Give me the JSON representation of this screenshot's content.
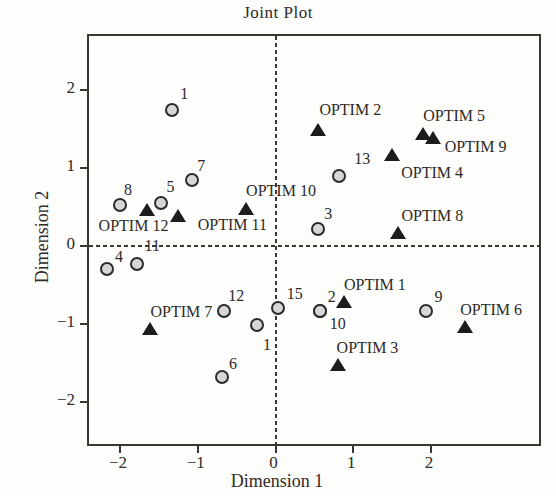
{
  "title": "Joint Plot",
  "colors": {
    "background": "#fdfdfc",
    "axis": "#3a3631",
    "text": "#2e2a26",
    "circle_fill": "#d6d6d6",
    "circle_edge": "#2b2b2b",
    "triangle_fill": "#1c1c1c",
    "dashed_line": "#3c3933"
  },
  "chart_data": {
    "type": "scatter",
    "title": "Joint Plot",
    "xlabel": "Dimension 1",
    "ylabel": "Dimension 2",
    "xlim": [
      -2.4,
      3.39
    ],
    "ylim": [
      -2.54,
      2.69
    ],
    "x_ticks": [
      -2,
      -1,
      0,
      1,
      2
    ],
    "y_ticks": [
      2,
      1,
      0,
      -1,
      -2
    ],
    "grid": false,
    "legend": "none",
    "reference_lines": {
      "vertical_at_x": 0,
      "horizontal_at_y": 0,
      "style": "dashed"
    },
    "series": [
      {
        "name": "cases",
        "marker": "circle",
        "points": [
          {
            "label": "1",
            "x": -1.33,
            "y": 1.74,
            "label_dx": 12,
            "label_dy": -16
          },
          {
            "label": "7",
            "x": -1.07,
            "y": 0.84,
            "label_dx": 9,
            "label_dy": -14
          },
          {
            "label": "8",
            "x": -2.0,
            "y": 0.53,
            "label_dx": 8,
            "label_dy": -15
          },
          {
            "label": "5",
            "x": -1.48,
            "y": 0.55,
            "label_dx": 10,
            "label_dy": -16
          },
          {
            "label": "13",
            "x": 0.82,
            "y": 0.89,
            "label_dx": 23,
            "label_dy": -17
          },
          {
            "label": "3",
            "x": 0.55,
            "y": 0.22,
            "label_dx": 10,
            "label_dy": -15
          },
          {
            "label": "4",
            "x": -2.17,
            "y": -0.3,
            "label_dx": 12,
            "label_dy": -12
          },
          {
            "label": "11",
            "x": -1.78,
            "y": -0.23,
            "label_dx": 15,
            "label_dy": -18
          },
          {
            "label": "12",
            "x": -0.66,
            "y": -0.84,
            "label_dx": 12,
            "label_dy": -15
          },
          {
            "label": "15",
            "x": 0.03,
            "y": -0.8,
            "label_dx": 17,
            "label_dy": -14
          },
          {
            "label": "2",
            "x": 0.57,
            "y": -0.84,
            "label_dx": 12,
            "label_dy": -14
          },
          {
            "label": "10",
            "x": 0.57,
            "y": -0.84,
            "label_dx": 18,
            "label_dy": 13
          },
          {
            "label": "9",
            "x": 1.93,
            "y": -0.83,
            "label_dx": 13,
            "label_dy": -14
          },
          {
            "label": "1",
            "x": -0.24,
            "y": -1.02,
            "label_dx": 10,
            "label_dy": 20
          },
          {
            "label": "6",
            "x": -0.69,
            "y": -1.68,
            "label_dx": 11,
            "label_dy": -13
          }
        ]
      },
      {
        "name": "OPTIM",
        "marker": "triangle",
        "points": [
          {
            "label": "OPTIM 2",
            "x": 0.55,
            "y": 1.48,
            "label_dx": 32,
            "label_dy": -20
          },
          {
            "label": "OPTIM 5",
            "x": 1.9,
            "y": 1.43,
            "label_dx": 31,
            "label_dy": -18
          },
          {
            "label": "OPTIM 9",
            "x": 2.02,
            "y": 1.38,
            "label_dx": 43,
            "label_dy": 9
          },
          {
            "label": "OPTIM 4",
            "x": 1.5,
            "y": 1.17,
            "label_dx": 40,
            "label_dy": 18
          },
          {
            "label": "OPTIM 8",
            "x": 1.58,
            "y": 0.17,
            "label_dx": 34,
            "label_dy": -17
          },
          {
            "label": "OPTIM 10",
            "x": -0.38,
            "y": 0.47,
            "label_dx": 35,
            "label_dy": -18
          },
          {
            "label": "OPTIM 12",
            "x": -1.66,
            "y": 0.46,
            "label_dx": -13,
            "label_dy": 16
          },
          {
            "label": "OPTIM 11",
            "x": -1.25,
            "y": 0.38,
            "label_dx": 54,
            "label_dy": 9
          },
          {
            "label": "OPTIM 7",
            "x": -1.61,
            "y": -1.06,
            "label_dx": 31,
            "label_dy": -17
          },
          {
            "label": "OPTIM 1",
            "x": 0.88,
            "y": -0.72,
            "label_dx": 31,
            "label_dy": -17
          },
          {
            "label": "OPTIM 3",
            "x": 0.81,
            "y": -1.53,
            "label_dx": 29,
            "label_dy": -17
          },
          {
            "label": "OPTIM 6",
            "x": 2.44,
            "y": -1.04,
            "label_dx": 26,
            "label_dy": -17
          }
        ]
      }
    ]
  }
}
